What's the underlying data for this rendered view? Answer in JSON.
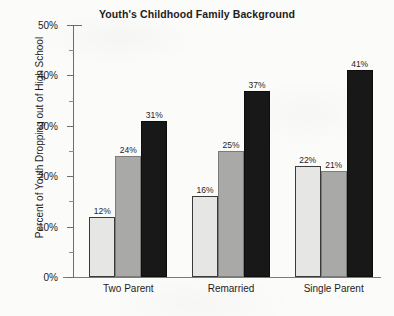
{
  "chart_data": {
    "type": "bar",
    "title": "Youth's Childhood Family Background",
    "xlabel": "",
    "ylabel": "Percent of Youth Dropping out of High School",
    "categories": [
      "Two Parent",
      "Remarried",
      "Single Parent"
    ],
    "series": [
      {
        "name": "series-1",
        "color": "#e6e6e4",
        "values": [
          12,
          24,
          31
        ]
      },
      {
        "name": "series-2",
        "color": "#a9a9a7",
        "values": [
          16,
          25,
          37
        ]
      },
      {
        "name": "series-3",
        "color": "#181818",
        "values": [
          22,
          21,
          41
        ]
      }
    ],
    "bar_groups": [
      {
        "category": "Two Parent",
        "bars": [
          {
            "value": 12,
            "label": "12%",
            "fill": "#e6e6e4"
          },
          {
            "value": 24,
            "label": "24%",
            "fill": "#a9a9a7"
          },
          {
            "value": 31,
            "label": "31%",
            "fill": "#181818"
          }
        ]
      },
      {
        "category": "Remarried",
        "bars": [
          {
            "value": 16,
            "label": "16%",
            "fill": "#e6e6e4"
          },
          {
            "value": 25,
            "label": "25%",
            "fill": "#a9a9a7"
          },
          {
            "value": 37,
            "label": "37%",
            "fill": "#181818"
          }
        ]
      },
      {
        "category": "Single Parent",
        "bars": [
          {
            "value": 22,
            "label": "22%",
            "fill": "#e6e6e4"
          },
          {
            "value": 21,
            "label": "21%",
            "fill": "#a9a9a7"
          },
          {
            "value": 41,
            "label": "41%",
            "fill": "#181818"
          }
        ]
      }
    ],
    "ylim": [
      0,
      50
    ],
    "ytick_values": [
      0,
      10,
      20,
      30,
      40,
      50
    ],
    "ytick_labels": [
      "0%",
      "10%",
      "20%",
      "30%",
      "40%",
      "50%"
    ],
    "yminor_tick_values": [
      5,
      15,
      25,
      35,
      45
    ],
    "grid": false,
    "legend": null,
    "annotations": []
  }
}
